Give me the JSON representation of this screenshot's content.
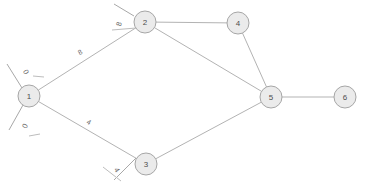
{
  "diagram": {
    "type": "undirected-weighted-graph",
    "background_color": "#ffffff",
    "node_fill_color": "#ebebeb",
    "node_stroke_color": "#a6a6a6",
    "edge_color": "#b3b3b3",
    "label_color": "#6b6b6b",
    "node_radius": 11
  },
  "nodes": [
    {
      "id": "1",
      "label": "1",
      "x": 29,
      "y": 96
    },
    {
      "id": "2",
      "label": "2",
      "x": 145,
      "y": 22
    },
    {
      "id": "3",
      "label": "3",
      "x": 146,
      "y": 164
    },
    {
      "id": "4",
      "label": "4",
      "x": 238,
      "y": 23
    },
    {
      "id": "5",
      "label": "5",
      "x": 271,
      "y": 97
    },
    {
      "id": "6",
      "label": "6",
      "x": 345,
      "y": 97
    }
  ],
  "edges": [
    {
      "id": "e12",
      "from": "1",
      "to": "2",
      "label": "8",
      "label_x": 80,
      "label_y": 52,
      "label_rotation": -32
    },
    {
      "id": "e13",
      "from": "1",
      "to": "3",
      "label": "4",
      "label_x": 89,
      "label_y": 122,
      "label_rotation": 30
    },
    {
      "id": "e24",
      "from": "2",
      "to": "4",
      "label": "",
      "label_x": 191,
      "label_y": 18,
      "label_rotation": 0
    },
    {
      "id": "e25",
      "from": "2",
      "to": "5",
      "label": "",
      "label_x": 208,
      "label_y": 60,
      "label_rotation": 0
    },
    {
      "id": "e45",
      "from": "4",
      "to": "5",
      "label": "",
      "label_x": 257,
      "label_y": 60,
      "label_rotation": 0
    },
    {
      "id": "e35",
      "from": "3",
      "to": "5",
      "label": "",
      "label_x": 209,
      "label_y": 131,
      "label_rotation": 0
    },
    {
      "id": "e56",
      "from": "5",
      "to": "6",
      "label": "",
      "label_x": 308,
      "label_y": 92,
      "label_rotation": 0
    }
  ],
  "stubs": [
    {
      "id": "s1-upper",
      "node": "1",
      "label": "0",
      "line": {
        "x1": 22,
        "y1": 88,
        "x2": 7,
        "y2": 64
      },
      "tick": {
        "x1": 33,
        "y1": 76,
        "x2": 44,
        "y2": 77
      },
      "label_x": 26,
      "label_y": 72,
      "label_rotation": 62
    },
    {
      "id": "s1-lower",
      "node": "1",
      "label": "0",
      "line": {
        "x1": 23,
        "y1": 105,
        "x2": 9,
        "y2": 130
      },
      "tick": {
        "x1": 29,
        "y1": 136,
        "x2": 40,
        "y2": 134
      },
      "label_x": 25,
      "label_y": 126,
      "label_rotation": -62
    },
    {
      "id": "s2-upper",
      "node": "2",
      "label": "8",
      "line": {
        "x1": 134,
        "y1": 16,
        "x2": 114,
        "y2": 4
      },
      "tick": {
        "x1": 112,
        "y1": 30,
        "x2": 136,
        "y2": 28
      },
      "label_x": 119,
      "label_y": 24,
      "label_rotation": -73
    },
    {
      "id": "s3-lower",
      "node": "3",
      "label": "4",
      "line": {
        "x1": 136,
        "y1": 158,
        "x2": 114,
        "y2": 180
      },
      "tick": {
        "x1": 103,
        "y1": 167,
        "x2": 121,
        "y2": 181
      },
      "label_x": 117,
      "label_y": 170,
      "label_rotation": 58
    }
  ]
}
